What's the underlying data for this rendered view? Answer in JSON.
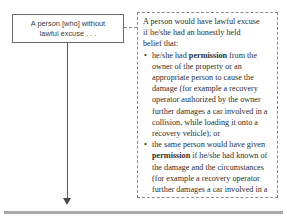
{
  "diagram": {
    "node": {
      "line1": "A person [who] without",
      "line2": "lawful excuse . . ."
    },
    "connector": {
      "style": "dashed",
      "icon": "dashed-link-icon"
    },
    "arrow": {
      "icon": "down-arrow-icon",
      "direction": "down"
    },
    "annotation": {
      "lead_line1": "A person would have lawful excuse",
      "lead_line2": "if he/she had an honestly held",
      "lead_line3": "belief that:",
      "bullet_glyph": "•",
      "bullets": [
        {
          "part1": "he/she had ",
          "emphasis": "permission",
          "part2": " from the owner of the property or an appropriate person to cause the damage (for example a recovery operator authorized by the owner further damages a car involved in a collision, while loading it onto a recovery vehicle); or"
        },
        {
          "part1": "the same person would have given ",
          "emphasis": "permission",
          "part2": " if he/she had known of the damage and the circumstances (for example a recovery operator further damages a car involved in a collision, while loading it onto a"
        }
      ]
    },
    "colors": {
      "node_border": "#6b6b6b",
      "annotation_border": "#8a8a8a",
      "text": "#2e2e2e",
      "node_text": "#3a3a3a",
      "rule": "#a8a8a8",
      "background": "#ffffff"
    }
  }
}
